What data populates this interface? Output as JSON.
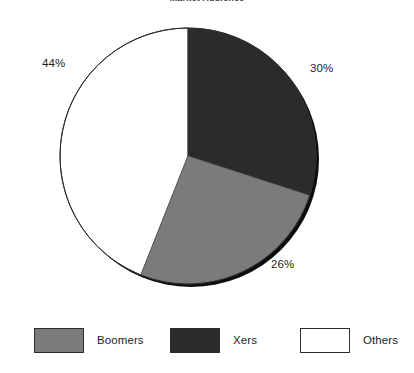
{
  "chart_data": {
    "type": "pie",
    "title": "Market Audience",
    "title_clipped": true,
    "categories": [
      "Xers",
      "Boomers",
      "Others"
    ],
    "values": [
      30,
      26,
      44
    ],
    "value_labels": [
      "30%",
      "26%",
      "44%"
    ],
    "unit": "%",
    "start_angle_deg": 0,
    "direction": "clockwise",
    "legend_position": "bottom",
    "grid": false,
    "xlabel": "",
    "ylabel": "",
    "slices": [
      {
        "name": "Xers",
        "value": 30,
        "label": "30%",
        "color": "#2b2b2b",
        "start_deg": 0,
        "end_deg": 108
      },
      {
        "name": "Boomers",
        "value": 26,
        "label": "26%",
        "color": "#7b7b7b",
        "start_deg": 108,
        "end_deg": 201.6
      },
      {
        "name": "Others",
        "value": 44,
        "label": "44%",
        "color": "#ffffff",
        "start_deg": 201.6,
        "end_deg": 360
      }
    ]
  },
  "chart": {
    "title": "Market Audience",
    "labels": {
      "others_pct": "44%",
      "xers_pct": "30%",
      "boomers_pct": "26%"
    }
  },
  "legend": {
    "items": [
      {
        "label": "Boomers",
        "color": "#7b7b7b"
      },
      {
        "label": "Xers",
        "color": "#2b2b2b"
      },
      {
        "label": "Others",
        "color": "#ffffff"
      }
    ]
  },
  "colors": {
    "boomers": "#7b7b7b",
    "xers": "#2b2b2b",
    "others": "#ffffff",
    "outline": "#2d2d2d",
    "shadow_rim": "#0d0d0d",
    "background": "#ffffff"
  }
}
